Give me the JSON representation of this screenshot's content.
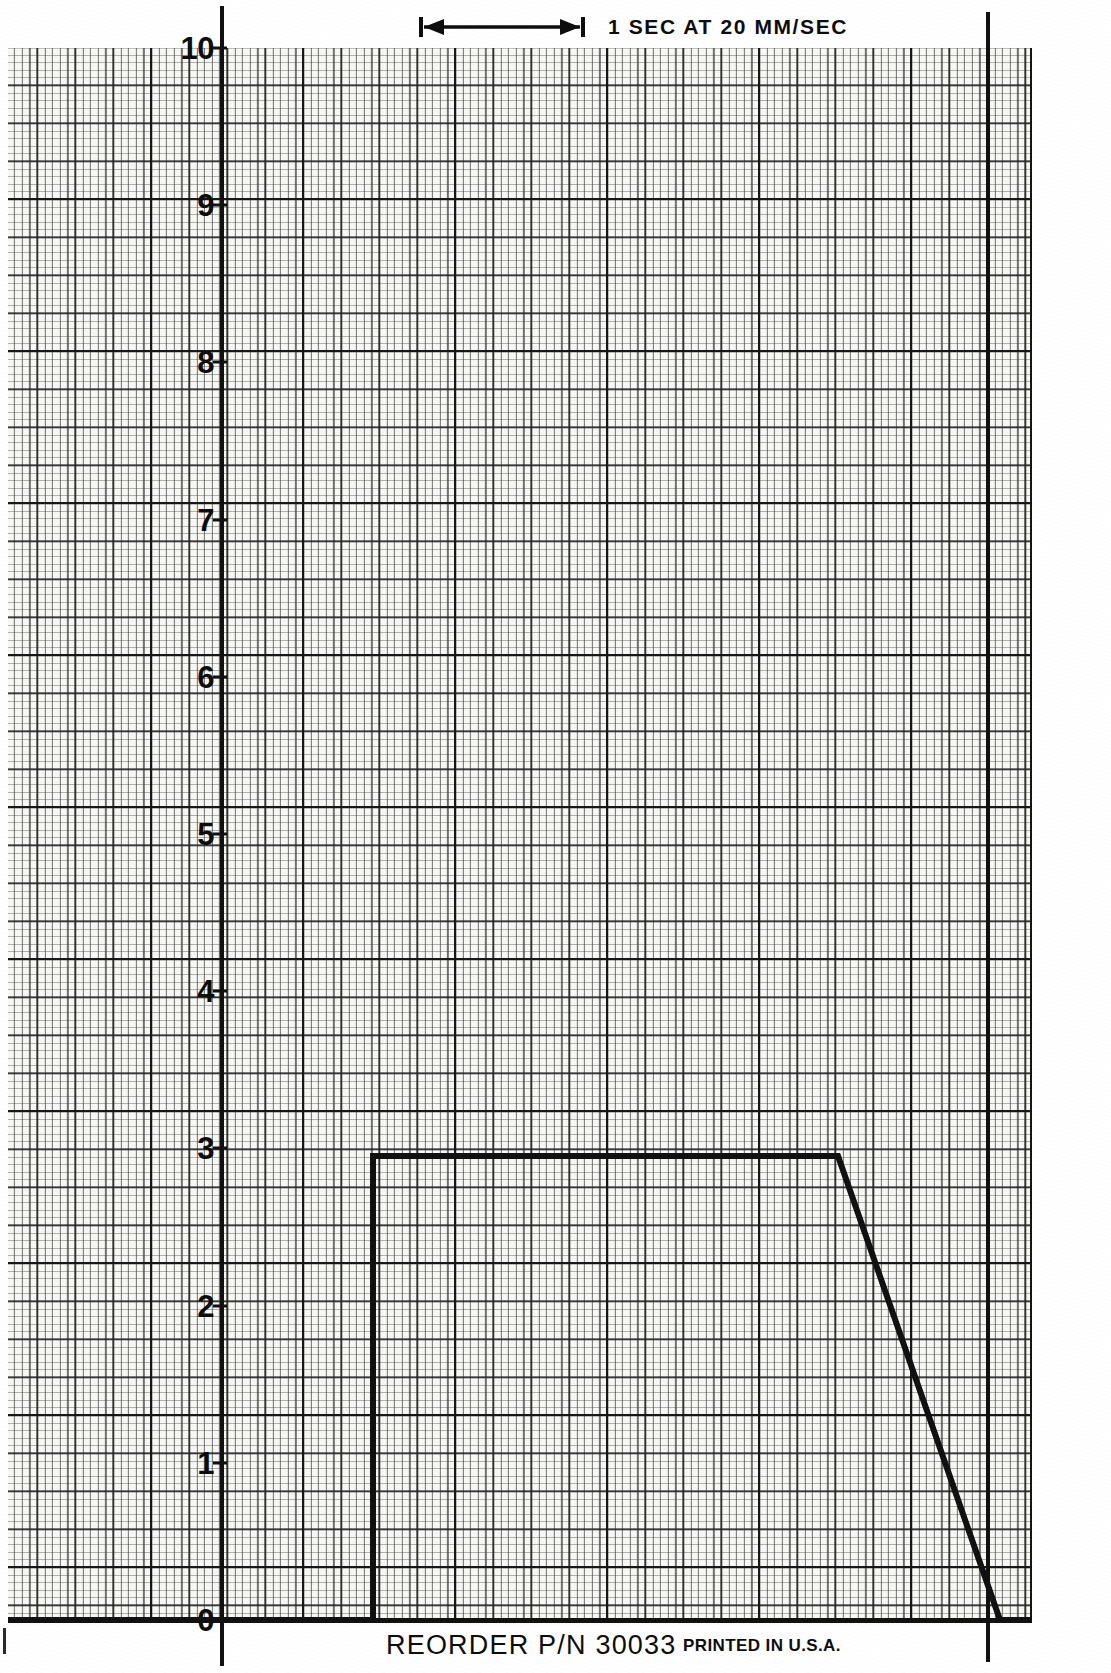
{
  "page": {
    "width": 1111,
    "height": 1673,
    "paper_color": "#f7f7f4",
    "ink_color": "#111111"
  },
  "annotations": {
    "timebase_label": "1 SEC AT 20 MM/SEC",
    "timebase_arrow_name": "double-headed-arrow-icon",
    "reorder_text": "REORDER P/N 30033",
    "printed_text": "PRINTED IN U.S.A."
  },
  "axis": {
    "y_tick_labels": [
      "10",
      "9",
      "8",
      "7",
      "6",
      "5",
      "4",
      "3",
      "2",
      "1",
      "0"
    ],
    "y_tick_values": [
      10,
      9,
      8,
      7,
      6,
      5,
      4,
      3,
      2,
      1,
      0
    ],
    "y_min": 0,
    "y_max": 10,
    "axis_line_x_px": 220,
    "marker_line_x_px": 986
  },
  "chart_data": {
    "type": "line",
    "title": "1 SEC AT 20 MM/SEC",
    "xlabel": "Time (seconds at 20 mm/sec)",
    "ylabel": "",
    "ylim": [
      0,
      10
    ],
    "xlim": [
      0,
      5.1
    ],
    "grid": true,
    "legend": "none",
    "y_tick_labels": [
      "0",
      "1",
      "2",
      "3",
      "4",
      "5",
      "6",
      "7",
      "8",
      "9",
      "10"
    ],
    "y_ticks": [
      0,
      1,
      2,
      3,
      4,
      5,
      6,
      7,
      8,
      9,
      10
    ],
    "x_unit_seconds_per_px": 0.00625,
    "series": [
      {
        "name": "recorded-trace",
        "color": "#111111",
        "line_width_px": 6,
        "x": [
          0.0,
          0.95,
          0.95,
          3.9,
          4.92,
          5.1
        ],
        "y": [
          0.0,
          0.0,
          3.0,
          3.0,
          0.0,
          0.0
        ],
        "points_px": [
          {
            "x": 8,
            "y": 1620
          },
          {
            "x": 373,
            "y": 1620
          },
          {
            "x": 373,
            "y": 1156
          },
          {
            "x": 838,
            "y": 1156
          },
          {
            "x": 1000,
            "y": 1620
          },
          {
            "x": 1032,
            "y": 1620
          }
        ],
        "description": "Baseline at 0, step rise to plateau value 3, flat plateau, then linear ramp down to 0"
      }
    ],
    "annotations": [
      {
        "name": "timebase-scale-bar",
        "text": "1 SEC AT 20 MM/SEC",
        "span_px": [
          425,
          585
        ],
        "duration_sec": 1
      },
      {
        "name": "event-marker-line",
        "x_px": 986,
        "label": ""
      }
    ]
  }
}
